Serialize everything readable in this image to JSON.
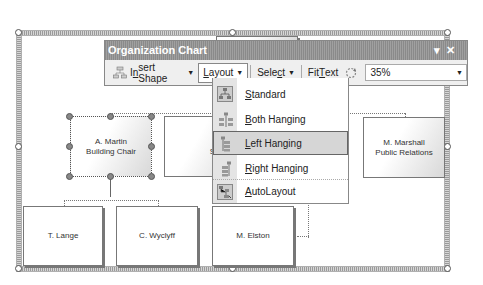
{
  "toolbar": {
    "title": "Organization Chart",
    "title_controls": {
      "dropdown_icon": "triangle-down-icon",
      "close_icon": "close-icon"
    },
    "insert_shape": {
      "label_pre": "I",
      "label_u": "n",
      "label_post": "sert Shape",
      "icon": "org-shape-icon"
    },
    "layout": {
      "label_pre": "",
      "label_u": "L",
      "label_post": "ayout"
    },
    "select": {
      "label_pre": "Sele",
      "label_u": "c",
      "label_post": "t"
    },
    "fit_text": {
      "label_pre": "Fit ",
      "label_u": "T",
      "label_post": "ext"
    },
    "zoom": {
      "icon": "zoom-rotate-icon",
      "value": "35%"
    }
  },
  "layout_menu": {
    "items": [
      {
        "u": "S",
        "rest": "tandard",
        "icon": "standard-layout-icon",
        "highlighted": false
      },
      {
        "u": "B",
        "rest": "oth Hanging",
        "icon": "both-hanging-icon",
        "highlighted": false
      },
      {
        "u": "L",
        "rest": "eft Hanging",
        "icon": "left-hanging-icon",
        "highlighted": true
      },
      {
        "u": "R",
        "rest": "ight Hanging",
        "icon": "right-hanging-icon",
        "highlighted": false
      },
      {
        "u": "A",
        "rest": "utoLayout",
        "icon": "autolayout-icon",
        "highlighted": false
      }
    ]
  },
  "chart": {
    "nodes": [
      {
        "name": "A. Martin",
        "title": "Building Chair",
        "selected": true
      },
      {
        "name": "J. Trio",
        "title": "Supplier",
        "selected": false
      },
      {
        "name": "M. Marshall",
        "title": "Public Relations",
        "selected": false
      },
      {
        "name": "T. Lange",
        "title": "",
        "selected": false
      },
      {
        "name": "C. Wyclyff",
        "title": "",
        "selected": false
      },
      {
        "name": "M. Elston",
        "title": "",
        "selected": false
      }
    ]
  }
}
